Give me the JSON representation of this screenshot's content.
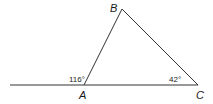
{
  "diagram": {
    "type": "triangle-with-exterior-angle",
    "vertices": [
      {
        "name": "A",
        "x": 84,
        "y": 85
      },
      {
        "name": "B",
        "x": 122,
        "y": 9
      },
      {
        "name": "C",
        "x": 198,
        "y": 85
      }
    ],
    "extended_line": {
      "from": "C",
      "through": "A",
      "extends_to_x": 10
    },
    "labels": {
      "A": "A",
      "B": "B",
      "C": "C"
    },
    "angles": {
      "exterior_at_A": "116°",
      "interior_at_C": "42°"
    },
    "colors": {
      "stroke": "#333333",
      "text": "#1a1a1a",
      "background": "#ffffff"
    }
  }
}
